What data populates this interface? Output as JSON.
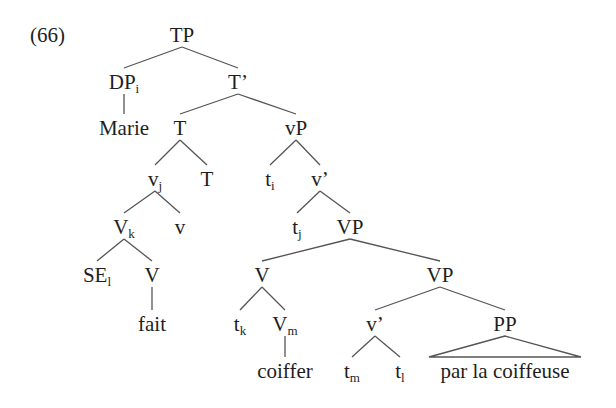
{
  "example_number": "(66)",
  "tree": {
    "nodes": [
      {
        "id": "TP",
        "label": "TP",
        "sub": ""
      },
      {
        "id": "DP",
        "label": "DP",
        "sub": "i"
      },
      {
        "id": "Tbar",
        "label": "T’",
        "sub": ""
      },
      {
        "id": "Marie",
        "label": "Marie",
        "sub": ""
      },
      {
        "id": "T1",
        "label": "T",
        "sub": ""
      },
      {
        "id": "vP",
        "label": "vP",
        "sub": ""
      },
      {
        "id": "vj",
        "label": "v",
        "sub": "j"
      },
      {
        "id": "T2",
        "label": "T",
        "sub": ""
      },
      {
        "id": "ti",
        "label": "t",
        "sub": "i"
      },
      {
        "id": "vbar1",
        "label": "v’",
        "sub": ""
      },
      {
        "id": "Vk",
        "label": "V",
        "sub": "k"
      },
      {
        "id": "v",
        "label": "v",
        "sub": ""
      },
      {
        "id": "tj",
        "label": "t",
        "sub": "j"
      },
      {
        "id": "VP1",
        "label": "VP",
        "sub": ""
      },
      {
        "id": "SEl",
        "label": "SE",
        "sub": "l"
      },
      {
        "id": "V1",
        "label": "V",
        "sub": ""
      },
      {
        "id": "V2",
        "label": "V",
        "sub": ""
      },
      {
        "id": "VP2",
        "label": "VP",
        "sub": ""
      },
      {
        "id": "fait",
        "label": "fait",
        "sub": ""
      },
      {
        "id": "tk",
        "label": "t",
        "sub": "k"
      },
      {
        "id": "Vm",
        "label": "V",
        "sub": "m"
      },
      {
        "id": "vbar2",
        "label": "v’",
        "sub": ""
      },
      {
        "id": "PP",
        "label": "PP",
        "sub": ""
      },
      {
        "id": "coiffer",
        "label": "coiffer",
        "sub": ""
      },
      {
        "id": "tm",
        "label": "t",
        "sub": "m"
      },
      {
        "id": "tl",
        "label": "t",
        "sub": "l"
      },
      {
        "id": "parla",
        "label": "par la coiffeuse",
        "sub": ""
      }
    ],
    "edges": [
      [
        "TP",
        "DP"
      ],
      [
        "TP",
        "Tbar"
      ],
      [
        "DP",
        "Marie"
      ],
      [
        "Tbar",
        "T1"
      ],
      [
        "Tbar",
        "vP"
      ],
      [
        "T1",
        "vj"
      ],
      [
        "T1",
        "T2"
      ],
      [
        "vP",
        "ti"
      ],
      [
        "vP",
        "vbar1"
      ],
      [
        "vj",
        "Vk"
      ],
      [
        "vj",
        "v"
      ],
      [
        "vbar1",
        "tj"
      ],
      [
        "vbar1",
        "VP1"
      ],
      [
        "Vk",
        "SEl"
      ],
      [
        "Vk",
        "V1"
      ],
      [
        "VP1",
        "V2"
      ],
      [
        "VP1",
        "VP2"
      ],
      [
        "V1",
        "fait"
      ],
      [
        "V2",
        "tk"
      ],
      [
        "V2",
        "Vm"
      ],
      [
        "VP2",
        "vbar2"
      ],
      [
        "VP2",
        "PP"
      ],
      [
        "Vm",
        "coiffer"
      ],
      [
        "vbar2",
        "tm"
      ],
      [
        "vbar2",
        "tl"
      ]
    ],
    "triangles": [
      [
        "PP",
        "parla"
      ]
    ]
  }
}
